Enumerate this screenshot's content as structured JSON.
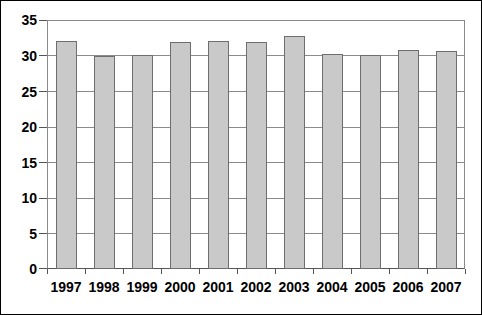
{
  "chart_data": {
    "type": "bar",
    "title": "",
    "subtitle": "",
    "xlabel": "",
    "ylabel": "",
    "categories": [
      "1997",
      "1998",
      "1999",
      "2000",
      "2001",
      "2002",
      "2003",
      "2004",
      "2005",
      "2006",
      "2007"
    ],
    "values": [
      32.0,
      29.9,
      30.1,
      31.9,
      32.1,
      31.9,
      32.7,
      30.2,
      30.1,
      30.8,
      30.6
    ],
    "series": [
      {
        "name": "",
        "values": [
          32.0,
          29.9,
          30.1,
          31.9,
          32.1,
          31.9,
          32.7,
          30.2,
          30.1,
          30.8,
          30.6
        ]
      }
    ],
    "ylim": [
      0,
      35
    ],
    "xlim": [
      0,
      11
    ],
    "ytick_labels": [
      "0",
      "5",
      "10",
      "15",
      "20",
      "25",
      "30",
      "35"
    ],
    "ytick_values": [
      0,
      5,
      10,
      15,
      20,
      25,
      30,
      35
    ],
    "grid": true,
    "grid_axis": "y",
    "legend": false,
    "legend_position": "none",
    "annotations": [],
    "colors": {
      "bar_fill": "#c9c9c9",
      "bar_border": "#6e6e6e",
      "gridline": "#8a8a8a",
      "axis": "#555555",
      "text": "#000000",
      "background": "#ffffff",
      "frame": "#000000"
    }
  }
}
